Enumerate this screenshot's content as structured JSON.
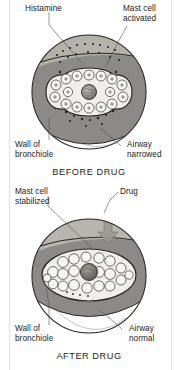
{
  "figure": {
    "colors": {
      "wall_fill": "#8c8a87",
      "muscle_band_fill": "#bab7b2",
      "lumen_fill": "#efeeeb",
      "cell_fill": "#f7f6f3",
      "core_fill": "#7c7a76",
      "outline": "#2a2724",
      "granule": "#231f20",
      "page_background": "#ffffff",
      "label_text": "#262220",
      "leader_line": "#4a4542"
    }
  },
  "panels": [
    {
      "id": "before",
      "caption": "BEFORE DRUG",
      "labels": [
        {
          "name": "histamine",
          "lines": [
            "Histamine"
          ]
        },
        {
          "name": "mast-cell-activated",
          "lines": [
            "Mast cell",
            "activated"
          ]
        },
        {
          "name": "wall-of-bronchiole",
          "lines": [
            "Wall of",
            "bronchiole"
          ]
        },
        {
          "name": "airway-narrowed",
          "lines": [
            "Airway",
            "narrowed"
          ]
        }
      ]
    },
    {
      "id": "after",
      "caption": "AFTER DRUG",
      "labels": [
        {
          "name": "mast-cell-stabilized",
          "lines": [
            "Mast cell",
            "stabilized"
          ]
        },
        {
          "name": "drug",
          "lines": [
            "Drug"
          ]
        },
        {
          "name": "wall-of-bronchiole",
          "lines": [
            "Wall of",
            "bronchiole"
          ]
        },
        {
          "name": "airway-normal",
          "lines": [
            "Airway",
            "normal"
          ]
        }
      ]
    }
  ]
}
